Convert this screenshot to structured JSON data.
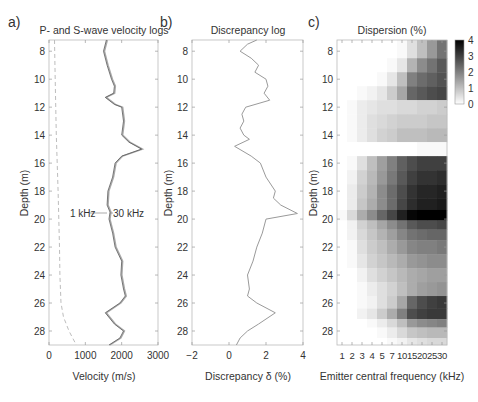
{
  "figure": {
    "panels": [
      {
        "letter": "a)",
        "title": "P- and S-wave velocity logs",
        "xlabel": "Velocity (m/s)",
        "ylabel": "Depth (m)"
      },
      {
        "letter": "b)",
        "title": "Discrepancy log",
        "xlabel": "Discrepancy δ (%)",
        "ylabel": "Depth (m)"
      },
      {
        "letter": "c)",
        "title": "Dispersion (%)",
        "xlabel": "Emitter central frequency (kHz)",
        "ylabel": "Depth (m)"
      }
    ],
    "annotations": {
      "left": "1 kHz",
      "right": "30 kHz"
    },
    "colorbar": {
      "ticks": [
        "0",
        "1",
        "2",
        "3",
        "4"
      ]
    },
    "depth_ticks": [
      "8",
      "10",
      "12",
      "14",
      "16",
      "18",
      "20",
      "22",
      "24",
      "26",
      "28"
    ],
    "a_xticks": [
      "0",
      "1000",
      "2000",
      "3000"
    ],
    "b_xticks": [
      "−2",
      "0",
      "2",
      "4"
    ],
    "c_xticks": [
      "1",
      "2",
      "3",
      "4",
      "5",
      "7",
      "10",
      "15",
      "20",
      "25",
      "30"
    ]
  },
  "chart_data": [
    {
      "type": "line",
      "title": "P- and S-wave velocity logs",
      "xlabel": "Velocity (m/s)",
      "ylabel": "Depth (m)",
      "xlim": [
        0,
        3000
      ],
      "ylim": [
        29,
        7.2
      ],
      "grid": false,
      "annotations": [
        "1 kHz",
        "30 kHz"
      ],
      "series": [
        {
          "name": "P-wave 1 kHz / 30 kHz (solid)",
          "depth": [
            7.2,
            8,
            9,
            10,
            10.5,
            11,
            11.3,
            11.8,
            12,
            13,
            14,
            14.5,
            15,
            15.5,
            16,
            17,
            18,
            19,
            19.5,
            20,
            21,
            22,
            23,
            24,
            25,
            25.5,
            26,
            26.7,
            27.5,
            28,
            28.5,
            29
          ],
          "velocity": [
            1580,
            1500,
            1600,
            1720,
            1800,
            1780,
            1550,
            1800,
            2000,
            2050,
            2000,
            2200,
            2550,
            2000,
            1820,
            1750,
            1620,
            1600,
            1680,
            1650,
            1750,
            1820,
            2000,
            1980,
            2050,
            2100,
            1950,
            1550,
            1800,
            2050,
            1950,
            1650
          ]
        },
        {
          "name": "S-wave (dashed)",
          "depth": [
            7.2,
            10,
            14,
            18,
            22,
            24,
            26,
            27,
            28,
            29
          ],
          "velocity": [
            150,
            170,
            200,
            250,
            290,
            300,
            330,
            400,
            550,
            750
          ]
        }
      ]
    },
    {
      "type": "line",
      "title": "Discrepancy log",
      "xlabel": "Discrepancy δ (%)",
      "ylabel": "Depth (m)",
      "xlim": [
        -2,
        4
      ],
      "ylim": [
        29,
        7.2
      ],
      "grid": false,
      "series": [
        {
          "name": "Discrepancy",
          "depth": [
            7.2,
            7.5,
            8,
            8.5,
            9,
            9.5,
            10,
            10.5,
            11,
            11.5,
            12,
            12.5,
            13,
            13.5,
            14,
            14.3,
            14.8,
            15.5,
            16,
            17,
            18,
            18.5,
            19,
            19.6,
            20,
            21,
            22,
            23,
            24,
            25,
            25.5,
            26,
            26.7,
            27.5,
            28,
            28.5,
            29
          ],
          "discrepancy": [
            1.5,
            1.0,
            0.6,
            1.2,
            1.6,
            1.4,
            2.0,
            2.1,
            1.9,
            2.2,
            0.9,
            0.7,
            0.8,
            0.6,
            0.8,
            1.1,
            0.3,
            1.2,
            1.7,
            2.0,
            2.5,
            2.4,
            2.8,
            3.7,
            2.0,
            1.8,
            1.5,
            1.3,
            1.0,
            1.1,
            1.0,
            1.5,
            2.5,
            1.6,
            1.0,
            0.6,
            0.4
          ]
        }
      ]
    },
    {
      "type": "heatmap",
      "title": "Dispersion (%)",
      "xlabel": "Emitter central frequency (kHz)",
      "ylabel": "Depth (m)",
      "x": [
        "1",
        "2",
        "3",
        "4",
        "5",
        "7",
        "10",
        "15",
        "20",
        "25",
        "30"
      ],
      "ylim": [
        29,
        7.2
      ],
      "zlim": [
        0,
        4
      ],
      "colormap": "gray (white=0, black=4)",
      "depth_rows": [
        8,
        9,
        10,
        11,
        12,
        13,
        14,
        15,
        16,
        17,
        18,
        19,
        19.7,
        20.5,
        21,
        22,
        23,
        24,
        25,
        26,
        26.8,
        27.5,
        28,
        29
      ],
      "values": [
        [
          0,
          0,
          0,
          0,
          0,
          0,
          0.1,
          0.5,
          1.0,
          1.6,
          2.2
        ],
        [
          0,
          0,
          0,
          0,
          0,
          0.1,
          0.4,
          1.2,
          1.8,
          2.2,
          2.6
        ],
        [
          0,
          0,
          0,
          0,
          0.1,
          0.4,
          1.0,
          2.0,
          2.3,
          2.5,
          2.7
        ],
        [
          0,
          0,
          0.1,
          0.2,
          0.4,
          0.8,
          1.4,
          2.4,
          2.6,
          2.8,
          2.9
        ],
        [
          0,
          0.1,
          0.3,
          0.4,
          0.5,
          0.5,
          0.6,
          0.6,
          0.7,
          0.7,
          0.8
        ],
        [
          0,
          0.1,
          0.3,
          0.5,
          0.6,
          0.7,
          0.8,
          0.8,
          0.8,
          0.9,
          0.9
        ],
        [
          0,
          0.1,
          0.3,
          0.5,
          0.7,
          0.8,
          1.0,
          1.0,
          1.0,
          1.1,
          1.1
        ],
        [
          0,
          0,
          0,
          0,
          0,
          0,
          0,
          0,
          0.1,
          0.1,
          0.1
        ],
        [
          0,
          0.1,
          0.5,
          1.0,
          1.5,
          2.0,
          2.5,
          2.8,
          3.0,
          3.0,
          3.0
        ],
        [
          0,
          0.2,
          0.7,
          1.1,
          1.6,
          2.1,
          2.6,
          3.0,
          3.2,
          3.2,
          3.3
        ],
        [
          0,
          0.3,
          0.8,
          1.2,
          1.8,
          2.3,
          2.8,
          3.2,
          3.4,
          3.4,
          3.5
        ],
        [
          0,
          0.3,
          0.9,
          1.3,
          1.8,
          2.3,
          2.9,
          3.3,
          3.5,
          3.5,
          3.6
        ],
        [
          0.1,
          0.6,
          1.3,
          1.8,
          2.4,
          2.9,
          3.5,
          3.9,
          4.0,
          4.0,
          4.0
        ],
        [
          0,
          0.2,
          0.7,
          1.0,
          1.4,
          1.8,
          2.2,
          2.6,
          2.8,
          2.8,
          2.9
        ],
        [
          0,
          0.2,
          0.6,
          0.9,
          1.2,
          1.5,
          1.9,
          2.2,
          2.3,
          2.4,
          2.4
        ],
        [
          0,
          0.1,
          0.5,
          0.8,
          1.0,
          1.3,
          1.6,
          1.9,
          2.0,
          2.0,
          2.1
        ],
        [
          0,
          0.1,
          0.4,
          0.7,
          0.9,
          1.1,
          1.3,
          1.6,
          1.7,
          1.8,
          1.8
        ],
        [
          0,
          0,
          0.2,
          0.5,
          0.7,
          0.9,
          1.1,
          1.3,
          1.4,
          1.5,
          1.5
        ],
        [
          0,
          0,
          0.1,
          0.3,
          0.5,
          0.7,
          1.0,
          1.3,
          1.5,
          1.6,
          1.7
        ],
        [
          0,
          0,
          0.1,
          0.2,
          0.5,
          0.8,
          1.4,
          2.4,
          2.8,
          3.0,
          3.1
        ],
        [
          0,
          0,
          0.2,
          0.4,
          0.8,
          1.3,
          2.0,
          2.8,
          3.0,
          3.1,
          3.1
        ],
        [
          0,
          0,
          0,
          0.1,
          0.3,
          0.6,
          1.0,
          1.6,
          1.8,
          1.9,
          2.0
        ],
        [
          0,
          0,
          0,
          0,
          0.1,
          0.3,
          0.6,
          0.9,
          1.0,
          1.1,
          1.1
        ],
        [
          0,
          0,
          0,
          0,
          0,
          0.1,
          0.2,
          0.4,
          0.5,
          0.6,
          0.6
        ]
      ]
    }
  ]
}
